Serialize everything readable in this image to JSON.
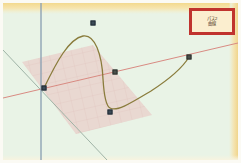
{
  "app": {
    "title": "3D Spline Curve Viewport",
    "background_color": "#e9f3e6",
    "frame_color": "#fbfaf4",
    "band_color": "#f3d98e"
  },
  "legend": {
    "border_color": "#c0332e",
    "fill_color": "#fbeecf",
    "line1": "パス2",
    "line2": "曲線"
  },
  "axes": [
    {
      "name": "vertical-axis",
      "color": "#8fa3b4",
      "x1": 38,
      "y1": 0,
      "x2": 38,
      "y2": 157,
      "width": 1.4
    },
    {
      "name": "horizontal-axis",
      "color": "#d88a82",
      "x1": 0,
      "y1": 95,
      "x2": 235,
      "y2": 40,
      "width": 1.0
    },
    {
      "name": "depth-axis",
      "color": "#9fb3a6",
      "x1": 0,
      "y1": 47,
      "x2": 104,
      "y2": 157,
      "width": 1.0
    }
  ],
  "plane": {
    "name": "reference-plane",
    "fill_color": "#e8c6c3",
    "opacity": 0.62,
    "grid_color": "#dcb6b2",
    "points": "19,59 90,42 149,112 73,131"
  },
  "curve": {
    "name": "spline-curve",
    "color": "#8a7c3c",
    "width": 1.3,
    "path": "M 41,85 C 54,58 66,36 80,33 C 92,31 99,52 100,76 C 101,92 103,103 107,105 C 114,109 128,100 148,88 C 165,77 180,64 186,54"
  },
  "control_points": [
    {
      "name": "origin-handle",
      "x": 41,
      "y": 85,
      "selected": true
    },
    {
      "name": "upper-handle",
      "x": 90,
      "y": 20,
      "selected": true
    },
    {
      "name": "mid-handle",
      "x": 112,
      "y": 69,
      "selected": false
    },
    {
      "name": "lower-handle",
      "x": 107,
      "y": 109,
      "selected": true
    },
    {
      "name": "right-handle",
      "x": 186,
      "y": 54,
      "selected": false
    }
  ],
  "colors": {
    "curve": "#8a7c3c",
    "plane": "#e8c6c3",
    "accent": "#c0332e",
    "axis_vertical": "#8fa3b4",
    "axis_horizontal": "#d88a82",
    "axis_depth": "#9fb3a6"
  }
}
